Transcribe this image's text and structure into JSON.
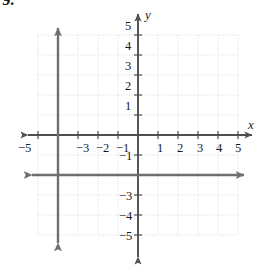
{
  "problem": {
    "number": "9."
  },
  "chart_data": {
    "type": "line",
    "title": "",
    "xlabel": "x",
    "ylabel": "y",
    "xlim": [
      -5,
      5
    ],
    "ylim": [
      -5,
      5
    ],
    "grid": true,
    "grid_style": "dotted",
    "legend": "none",
    "x_ticks": [
      -5,
      -4,
      -3,
      -2,
      -1,
      1,
      2,
      3,
      4,
      5
    ],
    "y_ticks": [
      5,
      4,
      3,
      2,
      1,
      -1,
      -2,
      -3,
      -4,
      -5
    ],
    "x_tick_labels_visible": [
      "-5",
      "-3",
      "-2",
      "-1",
      "1",
      "2",
      "3",
      "4",
      "5"
    ],
    "y_tick_labels_visible": [
      "5",
      "4",
      "3",
      "2",
      "1",
      "-1",
      "-3",
      "-4",
      "-5"
    ],
    "occluded_tick_labels": {
      "x": "-4",
      "y": "-2"
    },
    "series": [
      {
        "name": "vertical-line",
        "equation": "x = -4",
        "orientation": "vertical",
        "value": -4,
        "arrows": "both",
        "color": "#6e6e6e"
      },
      {
        "name": "horizontal-line",
        "equation": "y = -2",
        "orientation": "horizontal",
        "value": -2,
        "arrows": "both",
        "color": "#6e6e6e"
      }
    ],
    "axes": {
      "x_axis_arrows": "both",
      "y_axis_arrows": "both",
      "color": "#4f4f4f"
    },
    "colors": {
      "grid": "#d9d9d9",
      "axis": "#4f4f4f",
      "plot_line": "#6e6e6e",
      "text": "#1a1a1a",
      "background": "#ffffff"
    }
  },
  "tick_labels": {
    "x": [
      {
        "text": "-5",
        "left": 18,
        "top": 142
      },
      {
        "text": "-3",
        "left": 76,
        "top": 142
      },
      {
        "text": "-2",
        "left": 96,
        "top": 142
      },
      {
        "text": "-1",
        "left": 116,
        "top": 142
      },
      {
        "text": "1",
        "left": 157,
        "top": 142
      },
      {
        "text": "2",
        "left": 177,
        "top": 142
      },
      {
        "text": "3",
        "left": 197,
        "top": 142
      },
      {
        "text": "4",
        "left": 216,
        "top": 142
      },
      {
        "text": "5",
        "left": 235,
        "top": 142
      }
    ],
    "y": [
      {
        "text": "5",
        "left": 125,
        "top": 20
      },
      {
        "text": "4",
        "left": 125,
        "top": 40
      },
      {
        "text": "3",
        "left": 125,
        "top": 60
      },
      {
        "text": "2",
        "left": 125,
        "top": 80
      },
      {
        "text": "1",
        "left": 125,
        "top": 100
      },
      {
        "text": "-1",
        "left": 119,
        "top": 150
      },
      {
        "text": "-3",
        "left": 119,
        "top": 190
      },
      {
        "text": "-4",
        "left": 119,
        "top": 210
      },
      {
        "text": "-5",
        "left": 119,
        "top": 230
      }
    ]
  },
  "axis_names": {
    "x": "x",
    "y": "y"
  }
}
